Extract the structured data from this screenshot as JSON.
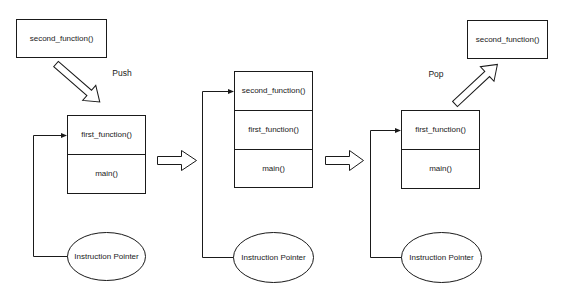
{
  "diagram": {
    "colors": {
      "stroke": "#1a1a1a",
      "fill": "#ffffff",
      "text": "#1a1a1a"
    },
    "stage1": {
      "incoming_frame": "second_function()",
      "operation": "Push",
      "stack": [
        "first_function()",
        "main()"
      ],
      "pointer": "Instruction Pointer",
      "pointer_target": "first_function()"
    },
    "stage2": {
      "stack": [
        "second_function()",
        "first_function()",
        "main()"
      ],
      "pointer": "Instruction Pointer",
      "pointer_target": "second_function()"
    },
    "stage3": {
      "outgoing_frame": "second_function()",
      "operation": "Pop",
      "stack": [
        "first_function()",
        "main()"
      ],
      "pointer": "Instruction Pointer",
      "pointer_target": "first_function()"
    },
    "transition_arrows": [
      "stage1-to-stage2",
      "stage2-to-stage3"
    ]
  }
}
